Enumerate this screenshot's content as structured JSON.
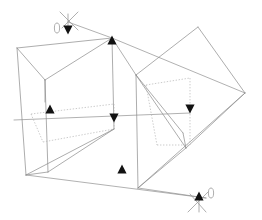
{
  "figure": {
    "canvas": {
      "width": 262,
      "height": 220
    },
    "background_color": "#ffffff",
    "solid_edge_color": "#8a8a8a",
    "hidden_edge_color": "#b5b5b5",
    "ray_color": "#8f8f8f",
    "arrow_color": "#121212",
    "line_width": 0.7
  },
  "chart_data": {
    "type": "diagram",
    "xlabel": "",
    "ylabel": "",
    "xlim": [
      0,
      262
    ],
    "ylim": [
      0,
      220
    ],
    "grid": false,
    "legend": "none",
    "elements": {
      "solid_edges": [
        {
          "name": "left-box-top-back",
          "points": "17,48 112,38"
        },
        {
          "name": "left-box-top-front",
          "points": "17,48 45,80"
        },
        {
          "name": "left-box-diag-upper",
          "points": "45,80 112,38"
        },
        {
          "name": "left-box-left-vertical",
          "points": "17,48 26,175"
        },
        {
          "name": "left-box-inner-vertical",
          "points": "45,80 48,172"
        },
        {
          "name": "left-box-center-vertical",
          "points": "112,38 114,129"
        },
        {
          "name": "left-box-bottom-front",
          "points": "26,175 114,129"
        },
        {
          "name": "left-box-bottom-edge",
          "points": "26,175 48,172"
        },
        {
          "name": "left-box-lower-diag",
          "points": "48,172 114,129"
        },
        {
          "name": "right-box-top-left",
          "points": "136,75 198,27"
        },
        {
          "name": "right-box-top-right",
          "points": "198,27 245,93"
        },
        {
          "name": "right-box-right-lower",
          "points": "245,93 186,148"
        },
        {
          "name": "right-box-diag-in",
          "points": "136,75 186,148"
        },
        {
          "name": "right-box-left-vertical",
          "points": "136,75 138,188"
        },
        {
          "name": "right-box-bottom-fold",
          "points": "138,188 186,148"
        },
        {
          "name": "right-box-fold-up",
          "points": "138,188 245,93"
        },
        {
          "name": "right-box-inner-fold",
          "points": "136,75 183,133"
        }
      ],
      "hidden_edges": [
        {
          "name": "left-hidden-top",
          "points": "31,114 114,104"
        },
        {
          "name": "left-hidden-left",
          "points": "31,114 43,142"
        },
        {
          "name": "left-hidden-bottom",
          "points": "43,142 114,129"
        },
        {
          "name": "left-hidden-right",
          "points": "114,104 114,129"
        },
        {
          "name": "right-hidden-top",
          "points": "146,85 190,78"
        },
        {
          "name": "right-hidden-right",
          "points": "190,78 190,145"
        },
        {
          "name": "right-hidden-bottom",
          "points": "157,145 190,145"
        },
        {
          "name": "right-hidden-left",
          "points": "146,85 157,145"
        }
      ],
      "rays": [
        {
          "name": "ray-upper-left-to-top-vertex",
          "points": "68,22 112,38"
        },
        {
          "name": "ray-top-vertex-to-right",
          "points": "112,38 245,93"
        },
        {
          "name": "ray-mid-horizontal",
          "points": "14,120 190,113"
        },
        {
          "name": "ray-lower-long",
          "points": "26,175 206,198"
        },
        {
          "name": "ray-bottom-right-marker",
          "points": "138,188 206,198"
        }
      ],
      "arrow_heads": [
        {
          "name": "arrow-top-up",
          "x": 112,
          "y": 40,
          "direction": "up"
        },
        {
          "name": "arrow-upper-left-down",
          "x": 68,
          "y": 30,
          "direction": "down"
        },
        {
          "name": "arrow-left-mid-up",
          "x": 50,
          "y": 109,
          "direction": "up"
        },
        {
          "name": "arrow-center-down",
          "x": 114,
          "y": 118,
          "direction": "down"
        },
        {
          "name": "arrow-right-mid-down",
          "x": 190,
          "y": 109,
          "direction": "down"
        },
        {
          "name": "arrow-lower-left-up",
          "x": 122,
          "y": 169,
          "direction": "up"
        },
        {
          "name": "arrow-bottom-right-up",
          "x": 199,
          "y": 196,
          "direction": "up"
        }
      ],
      "axis_markers": [
        {
          "name": "axis-marker-top-left",
          "center_x": 68,
          "center_y": 22,
          "ellipse_x": 57,
          "ellipse_y": 28,
          "ellipse_rx": 2.6,
          "ellipse_ry": 5.0
        },
        {
          "name": "axis-marker-bottom-right",
          "center_x": 199,
          "center_y": 203,
          "ellipse_x": 211,
          "ellipse_y": 193,
          "ellipse_rx": 2.6,
          "ellipse_ry": 5.0
        }
      ]
    }
  }
}
